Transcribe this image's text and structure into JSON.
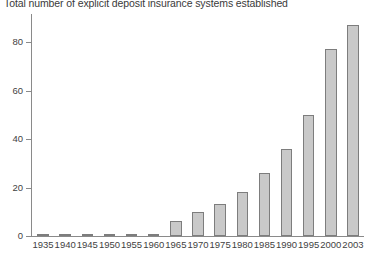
{
  "chart_data": {
    "type": "bar",
    "title": "Total number of explicit deposit insurance systems established",
    "xlabel": "",
    "ylabel": "",
    "categories": [
      "1935",
      "1940",
      "1945",
      "1950",
      "1955",
      "1960",
      "1965",
      "1970",
      "1975",
      "1980",
      "1985",
      "1990",
      "1995",
      "2000",
      "2003"
    ],
    "values": [
      1,
      1,
      1,
      1,
      1,
      1,
      6,
      10,
      13,
      18,
      26,
      36,
      50,
      77,
      87
    ],
    "ylim": [
      0,
      90
    ],
    "y_ticks": [
      "0",
      "20",
      "40",
      "60",
      "80"
    ],
    "y_tick_values": [
      0,
      20,
      40,
      60,
      80
    ],
    "grid": false,
    "legend": "none",
    "series_name": "Explicit deposit insurance systems",
    "bar_fill_color": "#c9c9c9",
    "bar_border_color": "#7d7d7d",
    "axis_color": "#8a8a8a",
    "text_color": "#3f3f3f",
    "background_color": "#ffffff"
  }
}
